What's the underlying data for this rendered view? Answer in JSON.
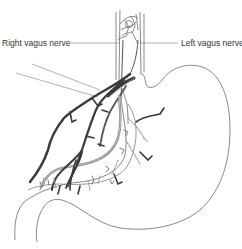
{
  "figure": {
    "labels": {
      "right_vagus": "Right vagus nerve",
      "left_vagus": "Left vagus nerve"
    },
    "colors": {
      "outline": "#6a6a6a",
      "nerve_dark": "#3a3a3a",
      "nerve_light": "#8a8a8a",
      "nerve_dotted": "#9a9a9a",
      "text": "#333333",
      "background": "#ffffff"
    }
  }
}
